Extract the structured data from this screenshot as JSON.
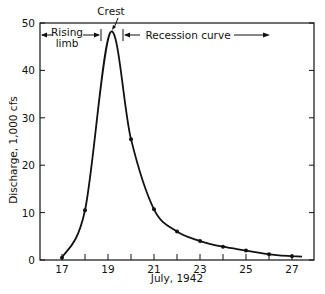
{
  "chart_data": {
    "type": "line",
    "title": "",
    "xlabel": "July, 1942",
    "ylabel": "Discharge, 1,000 cfs",
    "x_ticks": [
      "17",
      "19",
      "21",
      "23",
      "25",
      "27"
    ],
    "y_ticks": [
      "0",
      "10",
      "20",
      "30",
      "40",
      "50"
    ],
    "xlim": [
      16.1,
      27.9
    ],
    "ylim": [
      0,
      50
    ],
    "grid": false,
    "series": [
      {
        "name": "Hydrograph",
        "x": [
          17,
          18,
          19.1,
          20,
          21,
          22,
          23,
          24,
          25,
          26,
          27
        ],
        "y": [
          0.5,
          10.5,
          48,
          25.5,
          10.7,
          6,
          4,
          2.8,
          2,
          1.2,
          0.8
        ]
      }
    ],
    "annotations": {
      "crest": "Crest",
      "rising_limb": "Rising limb",
      "rising_limb_line1": "Rising",
      "rising_limb_line2": "limb",
      "recession_curve": "Recession curve"
    }
  }
}
